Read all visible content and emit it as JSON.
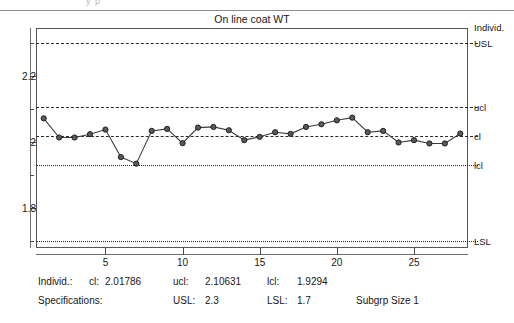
{
  "top_artifact": {
    "text": "y    p"
  },
  "chart": {
    "title": "On line coat WT",
    "right_axis_label": "Individ."
  },
  "chart_data": {
    "type": "line",
    "title": "On line coat WT",
    "xlabel": "",
    "ylabel": "",
    "grid": false,
    "legend": "none",
    "xlim": [
      0.5,
      28.5
    ],
    "ylim": [
      1.68,
      2.345
    ],
    "x": [
      1,
      2,
      3,
      4,
      5,
      6,
      7,
      8,
      9,
      10,
      11,
      12,
      13,
      14,
      15,
      16,
      17,
      18,
      19,
      20,
      21,
      22,
      23,
      24,
      25,
      26,
      27,
      28
    ],
    "values": [
      2.072,
      2.014,
      2.014,
      2.024,
      2.038,
      1.955,
      1.935,
      2.034,
      2.04,
      1.997,
      2.044,
      2.046,
      2.036,
      2.006,
      2.016,
      2.03,
      2.025,
      2.046,
      2.054,
      2.066,
      2.074,
      2.03,
      2.034,
      1.999,
      2.006,
      1.996,
      1.996,
      2.026
    ],
    "series": [
      {
        "name": "Individ.",
        "values": [
          2.072,
          2.014,
          2.014,
          2.024,
          2.038,
          1.955,
          1.935,
          2.034,
          2.04,
          1.997,
          2.044,
          2.046,
          2.036,
          2.006,
          2.016,
          2.03,
          2.025,
          2.046,
          2.054,
          2.066,
          2.074,
          2.03,
          2.034,
          1.999,
          2.006,
          1.996,
          1.996,
          2.026
        ]
      }
    ],
    "xticks": [
      5,
      10,
      15,
      20,
      25
    ],
    "xtick_labels": [
      "5",
      "10",
      "15",
      "20",
      "25"
    ],
    "xminor_ticks": [
      1,
      2,
      3,
      4,
      6,
      7,
      8,
      9,
      11,
      12,
      13,
      14,
      16,
      17,
      18,
      19,
      21,
      22,
      23,
      24,
      26,
      27,
      28
    ],
    "yticks": [
      1.8,
      2.0,
      2.2
    ],
    "ytick_labels": [
      "1.8",
      "2",
      "2.2"
    ],
    "yminor_ticks": [
      1.7,
      1.9,
      2.1,
      2.3
    ],
    "reference_lines": [
      {
        "id": "usl",
        "label": "USL",
        "value": 2.3,
        "style": "dashed"
      },
      {
        "id": "ucl",
        "label": "ucl",
        "value": 2.10631,
        "style": "dashed"
      },
      {
        "id": "cl",
        "label": "cl",
        "value": 2.01786,
        "style": "dashed"
      },
      {
        "id": "lcl",
        "label": "lcl",
        "value": 1.9294,
        "style": "dotted"
      },
      {
        "id": "lsl",
        "label": "LSL",
        "value": 1.7,
        "style": "dotted"
      }
    ]
  },
  "stats": {
    "row1": {
      "label": "Individ.:",
      "cl_label": "cl:",
      "cl_value": "2.01786",
      "ucl_label": "ucl:",
      "ucl_value": "2.10631",
      "lcl_label": "lcl:",
      "lcl_value": "1.9294"
    },
    "row2": {
      "label": "Specifications:",
      "usl_label": "USL:",
      "usl_value": "2.3",
      "lsl_label": "LSL:",
      "lsl_value": "1.7",
      "subgroup": "Subgrp Size 1"
    }
  }
}
